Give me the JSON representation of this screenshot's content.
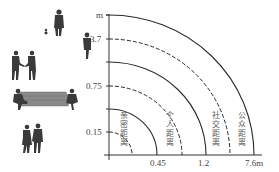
{
  "diagram": {
    "title": "",
    "y_axis": {
      "unit_label": "m",
      "ticks": [
        {
          "label": "3.7",
          "y": 39
        },
        {
          "label": "0.75",
          "y": 86
        },
        {
          "label": "0.15",
          "y": 132
        }
      ]
    },
    "x_axis": {
      "ticks": [
        {
          "label": "0.45",
          "x": 157
        },
        {
          "label": "1.2",
          "x": 206
        },
        {
          "label": "7.6m",
          "x": 254
        }
      ]
    },
    "zones": [
      {
        "name": "intimate-distance",
        "label_chars": [
          "亲",
          "密",
          "距",
          "离"
        ],
        "x": 120
      },
      {
        "name": "personal-distance",
        "label_chars": [
          "个",
          "人",
          "距",
          "离"
        ],
        "x": 166
      },
      {
        "name": "social-distance",
        "label_chars": [
          "社",
          "交",
          "距",
          "离"
        ],
        "x": 212
      },
      {
        "name": "public-distance",
        "label_chars": [
          "公",
          "众",
          "距",
          "离"
        ],
        "x": 238
      }
    ],
    "arcs": [
      {
        "rx": 23,
        "ry": 23,
        "style": "dashed"
      },
      {
        "rx": 48,
        "ry": 46,
        "style": "solid"
      },
      {
        "rx": 73,
        "ry": 69,
        "style": "dashed"
      },
      {
        "rx": 97,
        "ry": 93,
        "style": "solid"
      },
      {
        "rx": 121,
        "ry": 116,
        "style": "dashed"
      },
      {
        "rx": 145,
        "ry": 140,
        "style": "solid"
      }
    ],
    "illustrations": [
      "person-with-dog",
      "standing-person",
      "two-people-shaking-hands",
      "two-people-on-bench",
      "couple-holding-hands"
    ]
  }
}
